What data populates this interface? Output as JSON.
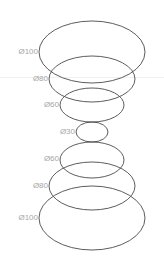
{
  "diagram": {
    "title": "",
    "stroke_color": "#4a4a4a",
    "label_color": "#a6a6a6",
    "guide_line_color": "#f1f1f1",
    "guide_line_y": 77,
    "rings": [
      {
        "label": "Ø100",
        "cx": 92,
        "cy": 52,
        "rx": 53,
        "ry": 31,
        "label_right": 128,
        "label_y": 48
      },
      {
        "label": "Ø80",
        "cx": 92,
        "cy": 79,
        "rx": 43,
        "ry": 23,
        "label_right": 116,
        "label_y": 75
      },
      {
        "label": "Ø60",
        "cx": 92,
        "cy": 105,
        "rx": 32,
        "ry": 17,
        "label_right": 105,
        "label_y": 101
      },
      {
        "label": "Ø30",
        "cx": 92,
        "cy": 132,
        "rx": 16,
        "ry": 10,
        "label_right": 90,
        "label_y": 128
      },
      {
        "label": "Ø60",
        "cx": 92,
        "cy": 160,
        "rx": 32,
        "ry": 18,
        "label_right": 105,
        "label_y": 155
      },
      {
        "label": "Ø80",
        "cx": 92,
        "cy": 186,
        "rx": 43,
        "ry": 24,
        "label_right": 116,
        "label_y": 182
      },
      {
        "label": "Ø100",
        "cx": 92,
        "cy": 218,
        "rx": 53,
        "ry": 32,
        "label_right": 127,
        "label_y": 214
      }
    ]
  }
}
